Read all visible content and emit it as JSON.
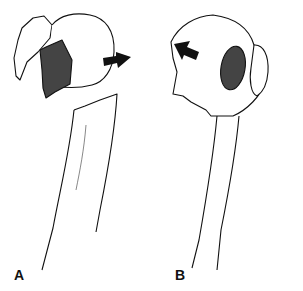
{
  "figure": {
    "panels": [
      {
        "label": "A",
        "description": "Proximal humerus fracture; greater tuberosity fragment displaced, humeral head rotated; arrow pointing right"
      },
      {
        "label": "B",
        "description": "Proximal humerus fracture; lesser tuberosity fragment, humeral head rotated; arrow pointing up-left"
      }
    ],
    "colors": {
      "line": "#111111",
      "background": "#ffffff"
    }
  }
}
